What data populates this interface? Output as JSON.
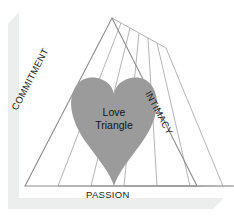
{
  "figure": {
    "title": "Love Triangle",
    "type": "diagram",
    "shape": "triangle-with-heart",
    "center_label_line1": "Love",
    "center_label_line2": "Triangle",
    "vertices_labels": {
      "left_edge": "COMMITMENT",
      "right_edge": "INTIMACY",
      "bottom_edge": "PASSION"
    },
    "echo_copies": 6,
    "colors": {
      "heart_fill": "#9b9b9b",
      "triangle_stroke": "#8d8d8d",
      "echo_stroke": "#a6a6a6",
      "frame_shadow": "#eceded",
      "background": "#ffffff",
      "text": "#1b1b1b"
    },
    "geometry": {
      "apex": [
        112,
        18
      ],
      "bottom_left": [
        25,
        186
      ],
      "bottom_right": [
        197,
        186
      ],
      "echo_offset_x": 9,
      "echo_offset_y": 5
    }
  }
}
